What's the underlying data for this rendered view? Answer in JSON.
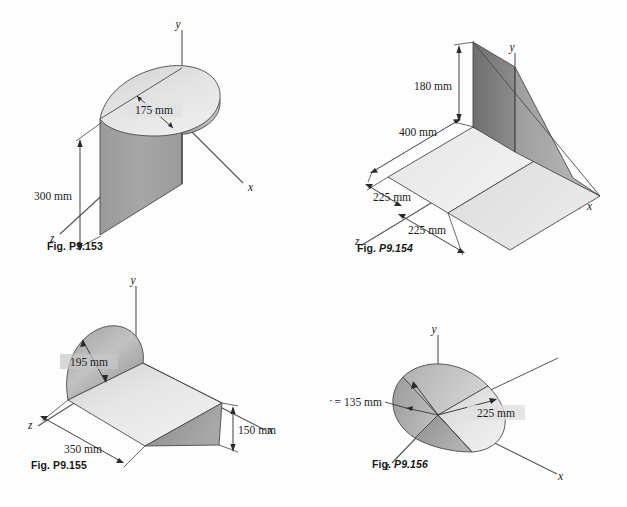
{
  "page": {
    "background_color": "#fdfdfd",
    "ink_color": "#1c1c1c"
  },
  "palette": {
    "outline": "#3a3a3a",
    "face_dark": "#8d8d8d",
    "face_mid": "#b4b4b4",
    "face_light": "#dcdcdc",
    "face_lightest": "#ededed",
    "axis_line": "#555555",
    "dim_line": "#2b2b2b"
  },
  "figures": [
    {
      "id": "fig-p9-153",
      "caption_word": "Fig.",
      "caption_number": "P9.153",
      "caption_italic": false,
      "shape": "half-cylindrical shell with semicircular top plate",
      "axes": [
        "y",
        "x",
        "z"
      ],
      "dimensions": [
        {
          "name": "radius-label",
          "text": "175 mm"
        },
        {
          "name": "height-label",
          "text": "300 mm"
        }
      ]
    },
    {
      "id": "fig-p9-154",
      "caption_word": "Fig.",
      "caption_number": "P9.154",
      "caption_italic": true,
      "shape": "flat rectangular plate in two halves with a vertical triangular fin",
      "axes": [
        "y",
        "x",
        "z"
      ],
      "dimensions": [
        {
          "name": "fin-height-label",
          "text": "180 mm"
        },
        {
          "name": "plate-length-label",
          "text": "400 mm"
        },
        {
          "name": "half-width-near-label",
          "text": "225 mm"
        },
        {
          "name": "half-width-far-label",
          "text": "225 mm"
        }
      ]
    },
    {
      "id": "fig-p9-155",
      "caption_word": "Fig.",
      "caption_number": "P9.155",
      "caption_italic": false,
      "shape": "wedge ramp with semicircular half-disk end cap",
      "axes": [
        "y",
        "x",
        "z"
      ],
      "dimensions": [
        {
          "name": "disk-radius-label",
          "text": "195 mm"
        },
        {
          "name": "depth-label",
          "text": "350 mm"
        },
        {
          "name": "ramp-height-label",
          "text": "150 mm"
        }
      ]
    },
    {
      "id": "fig-p9-156",
      "caption_word": "Fig.",
      "caption_number": "P9.156",
      "caption_italic": true,
      "shape": "oblique cone / circular sector solid with apex at origin",
      "axes": [
        "y",
        "x",
        "z"
      ],
      "dimensions": [
        {
          "name": "cone-radius-label",
          "text": "r = 135 mm"
        },
        {
          "name": "cone-length-label",
          "text": "225 mm"
        }
      ]
    }
  ],
  "labels": {
    "axis_y": "y",
    "axis_x": "x",
    "axis_z": "z",
    "d175": "175 mm",
    "d300": "300 mm",
    "d180": "180 mm",
    "d400": "400 mm",
    "d225a": "225 mm",
    "d225b": "225 mm",
    "d195": "195 mm",
    "d350": "350 mm",
    "d150": "150 mm",
    "r135_prefix": "r",
    "r135_rest": " = 135 mm",
    "d225c": "225 mm",
    "fig_word": "Fig.",
    "fig_153": "P9.153",
    "fig_154": "P9.154",
    "fig_155": "P9.155",
    "fig_156": "P9.156"
  }
}
